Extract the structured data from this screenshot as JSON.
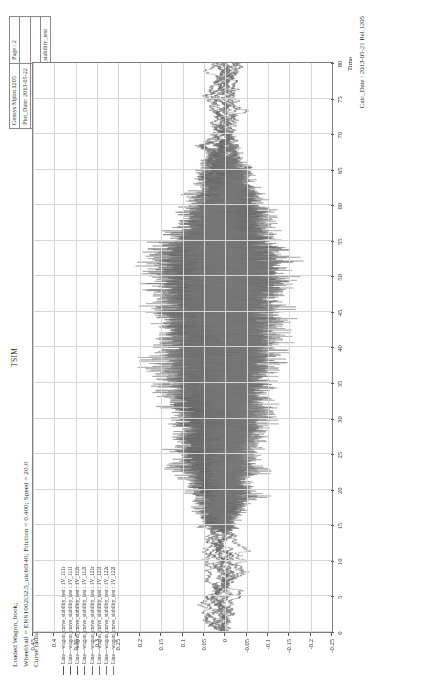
{
  "header": {
    "rows": [
      [
        {
          "text": "Gensys Mplot.1205"
        },
        {
          "text": "Page : 2"
        }
      ],
      [
        {
          "text": "Plot_Date: 2013-05-22"
        },
        {
          "text": ""
        }
      ],
      [
        {
          "text": "Plot_Time: 9:042"
        },
        {
          "text": ""
        }
      ],
      [
        {
          "text": "Mplot_ID: wagon_curve_stability_test"
        }
      ]
    ],
    "cells": {
      "product": "Gensys Mplot.1205",
      "page": "Page : 2",
      "plot_date_label": "Plot_Date: 2013-05-22",
      "plot_time_label": "Plot_Time: 9:042",
      "mplot_id_label": "Mplot_ID: wagon_curve_stability_test"
    }
  },
  "title": {
    "line1": "Loaded Wagon_book;",
    "line2": "Wheel/rail = ENS1002i32.5_uic60i40; Friction = 0.400; Speed = 20.0",
    "line3": "Curve radius = 500.; Track irr. = Class5",
    "center": "TSIM"
  },
  "footer": {
    "calc_date": "Calc_Date : 2013-05-21 Rel.1205"
  },
  "chart_data": {
    "type": "line",
    "title": "TSIM",
    "xlabel": "Time",
    "ylabel": "",
    "xlim": [
      0,
      80
    ],
    "ylim": [
      -0.25,
      0.45
    ],
    "grid": true,
    "legend_position": "left",
    "xticks": [
      0,
      5,
      10,
      15,
      20,
      25,
      30,
      35,
      40,
      45,
      50,
      55,
      60,
      65,
      70,
      75,
      80
    ],
    "xticklabels": [
      "0",
      "5",
      "10",
      "15",
      "20",
      "25",
      "30",
      "35",
      "40",
      "45",
      "50",
      "55",
      "60",
      "65",
      "70",
      "75",
      "80"
    ],
    "yticks": [
      0.45,
      0.4,
      0.35,
      0.3,
      0.25,
      0.2,
      0.15,
      0.1,
      0.05,
      0,
      -0.05,
      -0.1,
      -0.15,
      -0.2,
      -0.25
    ],
    "yticklabels": [
      "0.45",
      "0.4",
      "0.35",
      "0.3",
      "0.25",
      "0.2",
      "0.15",
      "0.1",
      "0.05",
      "0",
      "-0.05",
      "-0.1",
      "-0.15",
      "-0.2",
      "-0.25"
    ],
    "series": [
      {
        "name": "Line—wagon_curve_stability_test : 1V_111r",
        "color": "#555555",
        "seed": 11,
        "amp": 0.055,
        "band": 0.02
      },
      {
        "name": "Line—wagon_curve_stability_test : 1V_111l",
        "color": "#5a5a5a",
        "seed": 23,
        "amp": 0.05,
        "band": 0.01
      },
      {
        "name": "Line—wagon_curve_stability_test : 1V_112r",
        "color": "#606060",
        "seed": 37,
        "amp": 0.06,
        "band": 0.03
      },
      {
        "name": "Line—wagon_curve_stability_test : 1V_112l",
        "color": "#656565",
        "seed": 51,
        "amp": 0.048,
        "band": -0.01
      },
      {
        "name": "Line—wagon_curve_stability_test : 1V_121r",
        "color": "#6a6a6a",
        "seed": 67,
        "amp": 0.058,
        "band": 0.015
      },
      {
        "name": "Line—wagon_curve_stability_test : 1V_121l",
        "color": "#6f6f6f",
        "seed": 83,
        "amp": 0.052,
        "band": -0.005
      },
      {
        "name": "Line—wagon_curve_stability_test : 1V_122r",
        "color": "#747474",
        "seed": 97,
        "amp": 0.062,
        "band": 0.025
      },
      {
        "name": "Line—wagon_curve_stability_test : 1V_122l",
        "color": "#797979",
        "seed": 113,
        "amp": 0.045,
        "band": -0.015
      }
    ],
    "signal_envelope": {
      "comment": "dense oscillatory hunting signal; envelope grows to ~0.2 between t=18 and t=58, decays after t=60",
      "x_start": 14,
      "x_end": 72,
      "peak_x": 52,
      "peak_high": 0.21,
      "peak_low": -0.13
    }
  }
}
